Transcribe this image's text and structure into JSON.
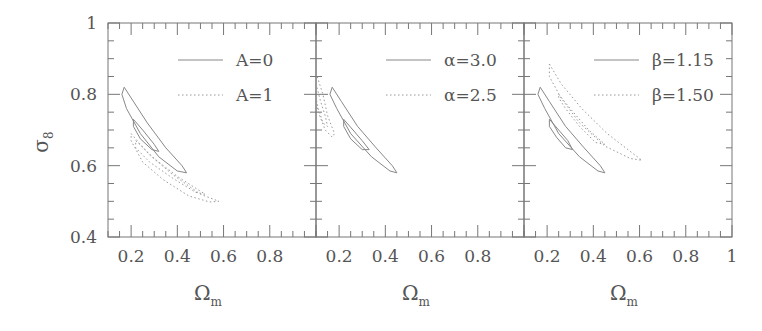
{
  "chart_data": {
    "type": "contour",
    "layout": "three panels side by side sharing y-axis",
    "ylabel": "σ8",
    "ylim": [
      0.4,
      1.0
    ],
    "yticks": [
      "0.4",
      "0.6",
      "0.8",
      "1"
    ],
    "grid": false,
    "panels": [
      {
        "xlabel": "Ωm",
        "xlim": [
          0.1,
          1.0
        ],
        "xticks": [
          "0.2",
          "0.4",
          "0.6",
          "0.8"
        ],
        "legend": [
          {
            "label": "A=0",
            "style": "solid"
          },
          {
            "label": "A=1",
            "style": "dotted"
          }
        ],
        "series": [
          {
            "name": "A=0",
            "style": "solid",
            "contours": [
              [
                [
                  0.17,
                  0.82
                ],
                [
                  0.2,
                  0.79
                ],
                [
                  0.27,
                  0.72
                ],
                [
                  0.35,
                  0.65
                ],
                [
                  0.42,
                  0.6
                ],
                [
                  0.44,
                  0.58
                ],
                [
                  0.4,
                  0.585
                ],
                [
                  0.32,
                  0.625
                ],
                [
                  0.24,
                  0.69
                ],
                [
                  0.18,
                  0.76
                ],
                [
                  0.16,
                  0.8
                ],
                [
                  0.17,
                  0.82
                ]
              ],
              [
                [
                  0.21,
                  0.73
                ],
                [
                  0.25,
                  0.7
                ],
                [
                  0.3,
                  0.66
                ],
                [
                  0.32,
                  0.64
                ],
                [
                  0.29,
                  0.645
                ],
                [
                  0.24,
                  0.675
                ],
                [
                  0.21,
                  0.71
                ],
                [
                  0.21,
                  0.73
                ]
              ]
            ]
          },
          {
            "name": "A=1",
            "style": "dotted",
            "contours": [
              [
                [
                  0.2,
                  0.69
                ],
                [
                  0.28,
                  0.63
                ],
                [
                  0.38,
                  0.575
                ],
                [
                  0.5,
                  0.52
                ],
                [
                  0.58,
                  0.5
                ],
                [
                  0.54,
                  0.498
                ],
                [
                  0.45,
                  0.515
                ],
                [
                  0.34,
                  0.56
                ],
                [
                  0.25,
                  0.61
                ],
                [
                  0.2,
                  0.67
                ],
                [
                  0.2,
                  0.69
                ]
              ],
              [
                [
                  0.22,
                  0.67
                ],
                [
                  0.3,
                  0.62
                ],
                [
                  0.4,
                  0.57
                ],
                [
                  0.52,
                  0.52
                ],
                [
                  0.48,
                  0.525
                ],
                [
                  0.38,
                  0.565
                ],
                [
                  0.28,
                  0.61
                ],
                [
                  0.22,
                  0.65
                ],
                [
                  0.22,
                  0.67
                ]
              ]
            ]
          }
        ]
      },
      {
        "xlabel": "Ωm",
        "xlim": [
          0.1,
          1.0
        ],
        "xticks": [
          "0.2",
          "0.4",
          "0.6",
          "0.8"
        ],
        "legend": [
          {
            "label": "α=3.0",
            "style": "solid"
          },
          {
            "label": "α=2.5",
            "style": "dotted"
          }
        ],
        "series": [
          {
            "name": "α=3.0",
            "style": "solid",
            "contours": [
              [
                [
                  0.17,
                  0.82
                ],
                [
                  0.21,
                  0.78
                ],
                [
                  0.28,
                  0.71
                ],
                [
                  0.36,
                  0.65
                ],
                [
                  0.43,
                  0.6
                ],
                [
                  0.45,
                  0.58
                ],
                [
                  0.42,
                  0.585
                ],
                [
                  0.34,
                  0.625
                ],
                [
                  0.25,
                  0.69
                ],
                [
                  0.19,
                  0.76
                ],
                [
                  0.16,
                  0.8
                ],
                [
                  0.17,
                  0.82
                ]
              ],
              [
                [
                  0.22,
                  0.73
                ],
                [
                  0.26,
                  0.7
                ],
                [
                  0.3,
                  0.67
                ],
                [
                  0.33,
                  0.645
                ],
                [
                  0.3,
                  0.645
                ],
                [
                  0.25,
                  0.675
                ],
                [
                  0.22,
                  0.71
                ],
                [
                  0.22,
                  0.73
                ]
              ]
            ]
          },
          {
            "name": "α=2.5",
            "style": "dotted",
            "contours": [
              [
                [
                  0.1,
                  0.86
                ],
                [
                  0.13,
                  0.8
                ],
                [
                  0.15,
                  0.74
                ],
                [
                  0.18,
                  0.69
                ],
                [
                  0.17,
                  0.68
                ],
                [
                  0.14,
                  0.7
                ],
                [
                  0.11,
                  0.75
                ],
                [
                  0.1,
                  0.78
                ]
              ],
              [
                [
                  0.1,
                  0.83
                ],
                [
                  0.12,
                  0.78
                ],
                [
                  0.14,
                  0.74
                ],
                [
                  0.15,
                  0.71
                ],
                [
                  0.13,
                  0.72
                ],
                [
                  0.11,
                  0.76
                ],
                [
                  0.1,
                  0.79
                ]
              ]
            ]
          }
        ]
      },
      {
        "xlabel": "Ωm",
        "xlim": [
          0.1,
          1.0
        ],
        "xticks": [
          "0.2",
          "0.4",
          "0.6",
          "0.8",
          "1"
        ],
        "legend": [
          {
            "label": "β=1.15",
            "style": "solid"
          },
          {
            "label": "β=1.50",
            "style": "dotted"
          }
        ],
        "series": [
          {
            "name": "β=1.15",
            "style": "solid",
            "contours": [
              [
                [
                  0.17,
                  0.82
                ],
                [
                  0.21,
                  0.78
                ],
                [
                  0.28,
                  0.71
                ],
                [
                  0.36,
                  0.65
                ],
                [
                  0.43,
                  0.6
                ],
                [
                  0.45,
                  0.58
                ],
                [
                  0.42,
                  0.585
                ],
                [
                  0.34,
                  0.625
                ],
                [
                  0.25,
                  0.69
                ],
                [
                  0.19,
                  0.76
                ],
                [
                  0.16,
                  0.8
                ],
                [
                  0.17,
                  0.82
                ]
              ],
              [
                [
                  0.21,
                  0.73
                ],
                [
                  0.25,
                  0.7
                ],
                [
                  0.29,
                  0.67
                ],
                [
                  0.31,
                  0.645
                ],
                [
                  0.28,
                  0.65
                ],
                [
                  0.24,
                  0.68
                ],
                [
                  0.21,
                  0.71
                ],
                [
                  0.21,
                  0.73
                ]
              ]
            ]
          },
          {
            "name": "β=1.50",
            "style": "dotted",
            "contours": [
              [
                [
                  0.21,
                  0.885
                ],
                [
                  0.26,
                  0.83
                ],
                [
                  0.35,
                  0.76
                ],
                [
                  0.46,
                  0.69
                ],
                [
                  0.58,
                  0.63
                ],
                [
                  0.61,
                  0.615
                ],
                [
                  0.56,
                  0.62
                ],
                [
                  0.45,
                  0.655
                ],
                [
                  0.34,
                  0.72
                ],
                [
                  0.26,
                  0.79
                ],
                [
                  0.21,
                  0.85
                ],
                [
                  0.21,
                  0.885
                ]
              ],
              [
                [
                  0.25,
                  0.8
                ],
                [
                  0.3,
                  0.76
                ],
                [
                  0.38,
                  0.7
                ],
                [
                  0.45,
                  0.66
                ],
                [
                  0.41,
                  0.665
                ],
                [
                  0.34,
                  0.71
                ],
                [
                  0.28,
                  0.76
                ],
                [
                  0.25,
                  0.79
                ],
                [
                  0.25,
                  0.8
                ]
              ]
            ]
          }
        ]
      }
    ]
  },
  "figure": {
    "ylabel_main": "σ",
    "ylabel_sub": "8",
    "xlabel_main": "Ω",
    "xlabel_sub": "m",
    "colors": {
      "axes": "#777777",
      "text": "#555555",
      "solid": "#888888",
      "dotted": "#999999"
    }
  }
}
